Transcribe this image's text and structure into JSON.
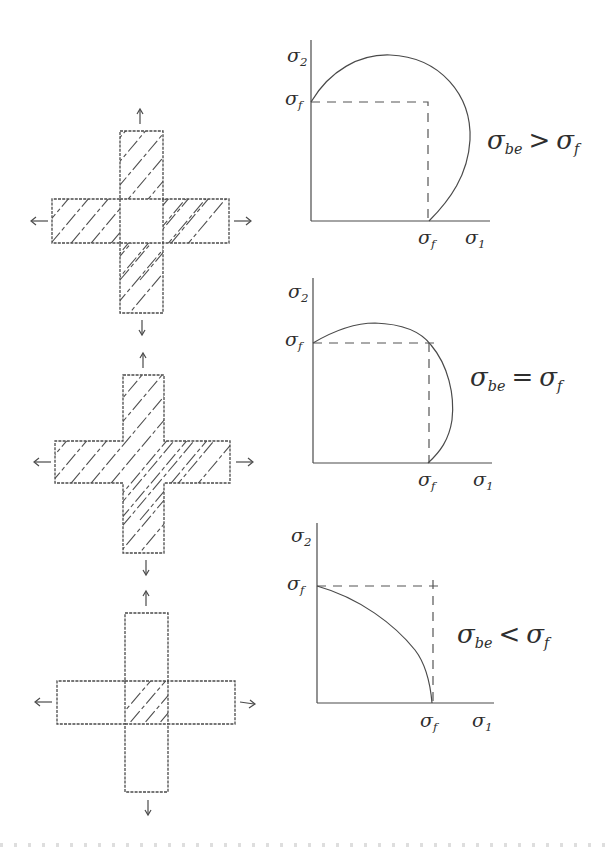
{
  "figure": {
    "panels": [
      {
        "id": "case-greater",
        "condition": {
          "lhs": "σ",
          "lhs_sub": "be",
          "op": ">",
          "rhs": "σ",
          "rhs_sub": "f"
        },
        "specimen": {
          "hatched_region": "arms only (center square unhatched)",
          "load_arrows": [
            "up",
            "down",
            "left",
            "right"
          ]
        },
        "plot": {
          "y_axis_label": "σ",
          "y_axis_sub": "2",
          "x_axis_label": "σ",
          "x_axis_sub": "1",
          "y_tick_label": "σ",
          "y_tick_sub": "f",
          "x_tick_label": "σ",
          "x_tick_sub": "f",
          "envelope": "large bulging curve exceeding σf in both directions"
        }
      },
      {
        "id": "case-equal",
        "condition": {
          "lhs": "σ",
          "lhs_sub": "be",
          "op": "=",
          "rhs": "σ",
          "rhs_sub": "f"
        },
        "specimen": {
          "hatched_region": "entire cross",
          "load_arrows": [
            "up",
            "down",
            "left",
            "right"
          ]
        },
        "plot": {
          "y_axis_label": "σ",
          "y_axis_sub": "2",
          "x_axis_label": "σ",
          "x_axis_sub": "1",
          "y_tick_label": "σ",
          "y_tick_sub": "f",
          "x_tick_label": "σ",
          "x_tick_sub": "f",
          "envelope": "curve passing through (σf, σf) corner"
        }
      },
      {
        "id": "case-less",
        "condition": {
          "lhs": "σ",
          "lhs_sub": "be",
          "op": "<",
          "rhs": "σ",
          "rhs_sub": "f"
        },
        "specimen": {
          "hatched_region": "center square only",
          "load_arrows": [
            "up",
            "down",
            "left",
            "right"
          ]
        },
        "plot": {
          "y_axis_label": "σ",
          "y_axis_sub": "2",
          "x_axis_label": "σ",
          "x_axis_sub": "1",
          "y_tick_label": "σ",
          "y_tick_sub": "f",
          "x_tick_label": "σ",
          "x_tick_sub": "f",
          "envelope": "concave-down curve inside the σf square"
        }
      }
    ]
  }
}
